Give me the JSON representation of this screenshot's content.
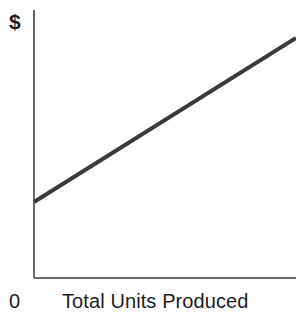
{
  "chart_data": {
    "type": "line",
    "title": "",
    "subtitle": "",
    "xlabel": "Total Units Produced",
    "ylabel": "$",
    "origin_label": "0",
    "grid": false,
    "legend": null,
    "xlim": [
      0,
      100
    ],
    "ylim": [
      0,
      100
    ],
    "axis_ticks": {
      "x": [
        "0"
      ],
      "y": []
    },
    "annotations": [],
    "series": [
      {
        "name": "Total Cost",
        "color": "#3a3a3a",
        "line_width": 4,
        "x": [
          0,
          100
        ],
        "y": [
          28,
          90
        ],
        "description": "Upward sloping straight line beginning above the origin (positive intercept), rising linearly to the right edge."
      }
    ]
  },
  "geometry": {
    "y_axis": {
      "x": 34,
      "y_top": 10,
      "y_bottom": 278,
      "color": "#6b6b6b",
      "width": 2
    },
    "x_axis": {
      "y": 278,
      "x_left": 34,
      "x_right": 296,
      "color": "#6b6b6b",
      "width": 2
    },
    "data_line": {
      "x1": 34,
      "y1": 202,
      "x2": 296,
      "y2": 38,
      "color": "#3a3a3a",
      "width": 4
    }
  },
  "colors": {
    "background": "#ffffff",
    "axis": "#6b6b6b",
    "line": "#3a3a3a",
    "text": "#1d1d1d"
  }
}
